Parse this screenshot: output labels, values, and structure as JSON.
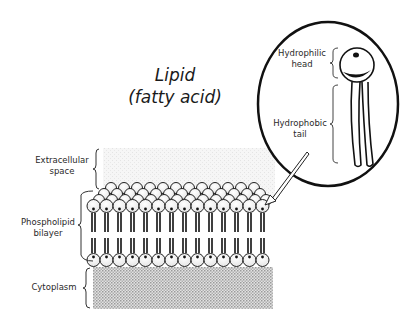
{
  "title": {
    "line1": "Lipid",
    "line2": "(fatty acid)"
  },
  "inset": {
    "head_label_line1": "Hydrophilic",
    "head_label_line2": "head",
    "tail_label_line1": "Hydrophobic",
    "tail_label_line2": "tail"
  },
  "membrane_labels": {
    "extracellular_line1": "Extracellular",
    "extracellular_line2": "space",
    "bilayer_line1": "Phospholipid",
    "bilayer_line2": "bilayer",
    "cytoplasm": "Cytoplasm"
  },
  "colors": {
    "ink": "#1a1a1a",
    "extracellular_fill": "#f1f1f1",
    "cytoplasm_fill": "#cfcfcf"
  }
}
